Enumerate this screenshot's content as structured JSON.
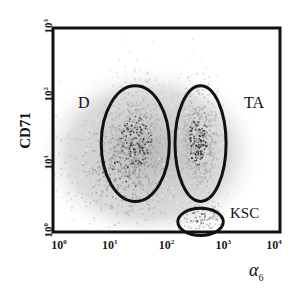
{
  "chart_data": {
    "type": "scatter",
    "subtype": "flow-cytometry density dot plot",
    "title": "",
    "xlabel": "α6",
    "ylabel": "CD71",
    "x_scale": "log",
    "y_scale": "log",
    "xlim": [
      1,
      10000
    ],
    "ylim": [
      1,
      1000
    ],
    "x_ticks": [
      {
        "base": "10",
        "exp": "0"
      },
      {
        "base": "10",
        "exp": "1"
      },
      {
        "base": "10",
        "exp": "2"
      },
      {
        "base": "10",
        "exp": "3"
      },
      {
        "base": "10",
        "exp": "4"
      }
    ],
    "y_ticks": [
      {
        "base": "10",
        "exp": "0"
      },
      {
        "base": "10",
        "exp": "1"
      },
      {
        "base": "10",
        "exp": "2"
      },
      {
        "base": "10",
        "exp": "3"
      }
    ],
    "grid": false,
    "legend": null,
    "gates": [
      {
        "label": "D",
        "shape": "ellipse",
        "x_center_log": 1.45,
        "y_center_log": 1.3,
        "x_radius_log": 0.6,
        "y_radius_log": 0.85
      },
      {
        "label": "TA",
        "shape": "ellipse",
        "x_center_log": 2.6,
        "y_center_log": 1.3,
        "x_radius_log": 0.45,
        "y_radius_log": 0.85
      },
      {
        "label": "KSC",
        "shape": "ellipse",
        "x_center_log": 2.6,
        "y_center_log": 0.15,
        "x_radius_log": 0.4,
        "y_radius_log": 0.2
      }
    ],
    "populations": [
      {
        "name": "D",
        "center_log": [
          1.45,
          1.35
        ],
        "density": "high"
      },
      {
        "name": "TA",
        "center_log": [
          2.55,
          1.35
        ],
        "density": "high"
      },
      {
        "name": "KSC",
        "center_log": [
          2.6,
          0.2
        ],
        "density": "low"
      },
      {
        "name": "background",
        "center_log": [
          1.5,
          1.1
        ],
        "density": "diffuse"
      }
    ]
  },
  "axes": {
    "y_label": "CD71",
    "x_label_symbol": "α",
    "x_label_sub": "6"
  },
  "gate_labels": {
    "d": "D",
    "ta": "TA",
    "ksc": "KSC"
  }
}
